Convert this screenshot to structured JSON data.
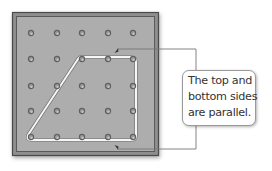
{
  "figure": {
    "board": {
      "rows": 5,
      "cols": 5,
      "peg_x": [
        31,
        57,
        82,
        108,
        133
      ],
      "peg_y": [
        33,
        59,
        86,
        111,
        137
      ],
      "board_color": "#aeaeae",
      "frame_color": "#555555",
      "peg_color": "#606060"
    },
    "shape": {
      "type": "trapezoid",
      "vertices": [
        [
          82,
          59
        ],
        [
          133,
          59
        ],
        [
          133,
          137
        ],
        [
          31,
          137
        ]
      ],
      "band_color": "#f4f4f4"
    },
    "callout": {
      "lines": [
        "The top and",
        "bottom sides",
        "are parallel."
      ],
      "text": "The top and bottom sides are parallel.",
      "points_to": [
        "top side",
        "bottom side"
      ]
    }
  }
}
